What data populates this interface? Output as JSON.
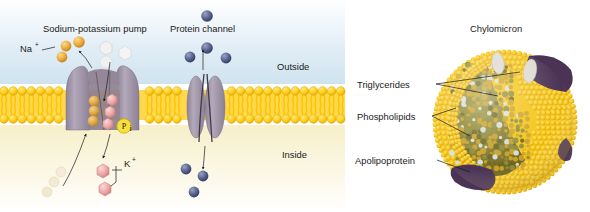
{
  "figure": {
    "panels": [
      {
        "id": "membrane-transport",
        "labels": {
          "pump_title": "Sodium-potassium pump",
          "channel_title": "Protein channel",
          "outside": "Outside",
          "inside": "Inside",
          "sodium_ion": "Na",
          "sodium_charge": "+",
          "potassium_ion": "K",
          "potassium_charge": "+",
          "phosphate": "P",
          "phosphate_sub": "i"
        },
        "colors": {
          "outside_bg": "#dcecf5",
          "inside_bg": "#faf2d2",
          "lipid_head": "#ffd21f",
          "lipid_tail": "#ffd84d",
          "protein": "#a79cb0",
          "protein_dark": "#6f6478",
          "sodium": "#e8a93a",
          "potassium": "#eea6a6",
          "channel_ion": "#545f8c",
          "phosphate_circle": "#f7e03a",
          "faded_ion": "#efe7cf"
        }
      },
      {
        "id": "chylomicron",
        "labels": {
          "title": "Chylomicron",
          "triglycerides": "Triglycerides",
          "phospholipids": "Phospholipids",
          "apolipoprotein": "Apolipoprotein"
        },
        "colors": {
          "shell_bead": "#f5c518",
          "shell_bead_dark": "#e0a800",
          "core": "#7e7526",
          "core_bead": "#c9a227",
          "apolipoprotein": "#4a3355",
          "protein_nub": "#ded9d2"
        }
      }
    ]
  }
}
